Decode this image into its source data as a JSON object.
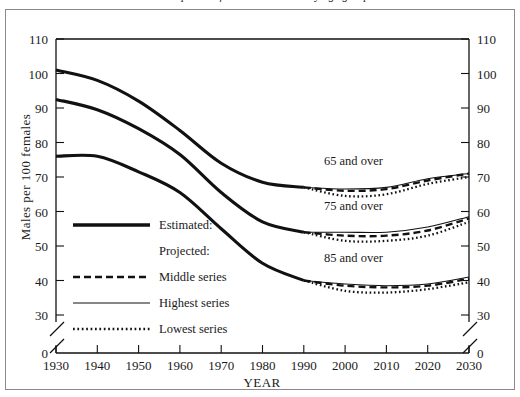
{
  "caption": {
    "text": "Males per 100 females in the U.S. by age group"
  },
  "chart_data": {
    "type": "line",
    "title": "",
    "xlabel": "YEAR",
    "ylabel": "Males per 100 females",
    "xlim": [
      1930,
      2030
    ],
    "ylim": [
      30,
      110
    ],
    "y_axis_break_below": 30,
    "grid": false,
    "legend_position": "inside-left",
    "x_tick_labels": [
      "1930",
      "1940",
      "1950",
      "1960",
      "1970",
      "1980",
      "1990",
      "2000",
      "2010",
      "2020",
      "2030"
    ],
    "y_tick_labels": [
      "0",
      "30",
      "40",
      "50",
      "60",
      "70",
      "80",
      "90",
      "100",
      "110"
    ],
    "y_tick_labels_right": [
      "0",
      "30",
      "40",
      "50",
      "60",
      "70",
      "80",
      "90",
      "100",
      "110"
    ],
    "x": [
      1930,
      1940,
      1950,
      1960,
      1970,
      1980,
      1990,
      2000,
      2010,
      2020,
      2030
    ],
    "annotations": [
      {
        "text": "65 and over",
        "x": 2002,
        "y": 73.5
      },
      {
        "text": "75 and over",
        "x": 2002,
        "y": 60.5
      },
      {
        "text": "85 and over",
        "x": 2002,
        "y": 45.5
      }
    ],
    "groups": [
      {
        "name": "65 and over",
        "estimated": {
          "x": [
            1930,
            1940,
            1950,
            1960,
            1970,
            1980,
            1990
          ],
          "values": [
            101.0,
            98.0,
            92.0,
            83.5,
            74.0,
            68.5,
            67.0
          ]
        },
        "projected": {
          "x": [
            1990,
            2000,
            2010,
            2020,
            2030
          ],
          "middle": [
            67.0,
            66.0,
            66.5,
            69.0,
            71.0
          ],
          "highest": [
            67.0,
            66.5,
            67.0,
            69.5,
            71.0
          ],
          "lowest": [
            67.0,
            64.5,
            65.0,
            68.0,
            70.0
          ]
        }
      },
      {
        "name": "75 and over",
        "estimated": {
          "x": [
            1930,
            1940,
            1950,
            1960,
            1970,
            1980,
            1990
          ],
          "values": [
            92.5,
            89.5,
            84.0,
            76.5,
            65.5,
            57.0,
            54.0
          ]
        },
        "projected": {
          "x": [
            1990,
            2000,
            2010,
            2020,
            2030
          ],
          "middle": [
            54.0,
            53.0,
            53.0,
            54.5,
            58.0
          ],
          "highest": [
            54.0,
            54.0,
            54.0,
            55.5,
            58.5
          ],
          "lowest": [
            54.0,
            51.5,
            51.5,
            53.0,
            57.0
          ]
        }
      },
      {
        "name": "85 and over",
        "estimated": {
          "x": [
            1930,
            1940,
            1950,
            1960,
            1970,
            1980,
            1990
          ],
          "values": [
            76.0,
            76.0,
            71.5,
            65.5,
            55.0,
            45.0,
            40.0
          ]
        },
        "projected": {
          "x": [
            1990,
            2000,
            2010,
            2020,
            2030
          ],
          "middle": [
            40.0,
            38.5,
            38.0,
            38.5,
            40.5
          ],
          "highest": [
            40.0,
            39.0,
            38.5,
            39.0,
            41.0
          ],
          "lowest": [
            40.0,
            37.0,
            36.5,
            37.5,
            39.5
          ]
        }
      }
    ],
    "legend": {
      "entries": [
        {
          "label": "Estimated:",
          "style": "thick-solid",
          "is_header": false
        },
        {
          "label": "Projected:",
          "style": "none",
          "is_header": true
        },
        {
          "label": "Middle series",
          "style": "dashed",
          "is_header": false
        },
        {
          "label": "Highest series",
          "style": "thin-solid",
          "is_header": false
        },
        {
          "label": "Lowest series",
          "style": "dotted",
          "is_header": false
        }
      ]
    }
  }
}
